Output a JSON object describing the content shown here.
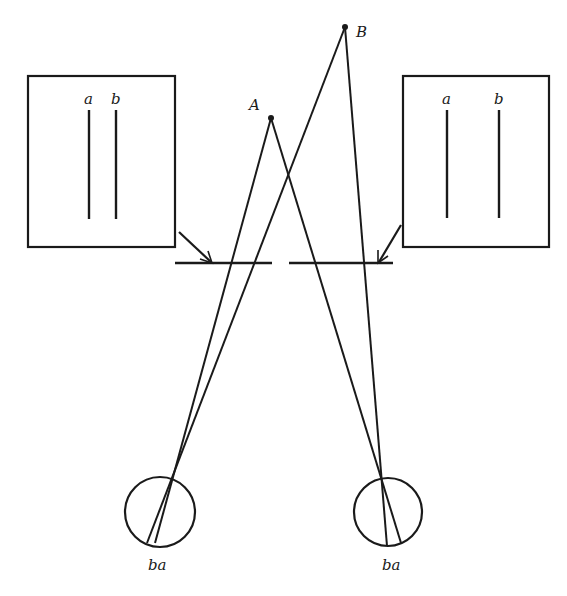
{
  "diagram": {
    "points": [
      {
        "id": "A",
        "label": "A",
        "x": 271,
        "y": 118
      },
      {
        "id": "B",
        "label": "B",
        "x": 345,
        "y": 27
      }
    ],
    "left_panel": {
      "labels": {
        "a": "a",
        "b": "b"
      }
    },
    "right_panel": {
      "labels": {
        "a": "a",
        "b": "b"
      }
    },
    "left_eye": {
      "retina_label": "ba"
    },
    "right_eye": {
      "retina_label": "ba"
    },
    "colors": {
      "ink": "#1a1a1a",
      "background": "#ffffff"
    }
  }
}
